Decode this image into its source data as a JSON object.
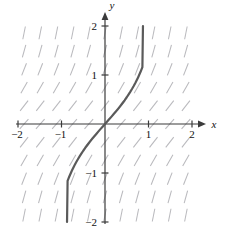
{
  "figure": {
    "title": "",
    "background": "#ffffff",
    "width": 229,
    "height": 231
  },
  "axes": {
    "x_label": "x",
    "y_label": "y",
    "x_ticks": [
      {
        "value": -2,
        "label": "−2"
      },
      {
        "value": -1,
        "label": "−1"
      },
      {
        "value": 1,
        "label": "1"
      },
      {
        "value": 2,
        "label": "2"
      }
    ],
    "y_ticks": [
      {
        "value": 2,
        "label": "2"
      },
      {
        "value": 1,
        "label": "1"
      },
      {
        "value": -1,
        "label": "−1"
      },
      {
        "value": -2,
        "label": "−2"
      }
    ],
    "axis_color": "#3b3b3b",
    "arrow_x": true,
    "arrow_y": true
  },
  "chart_data": {
    "type": "line",
    "title": "",
    "xlabel": "x",
    "ylabel": "y",
    "xlim": [
      -2,
      2
    ],
    "ylim": [
      -2,
      2
    ],
    "grid": false,
    "legend": null,
    "series": [
      {
        "name": "solution curve y = tan(x)",
        "color": "#5a5a5a",
        "linewidth": 2.2,
        "x": [
          -0.8726,
          -0.86,
          -0.84,
          -0.82,
          -0.8,
          -0.78,
          -0.76,
          -0.74,
          -0.72,
          -0.7,
          -0.66,
          -0.62,
          -0.58,
          -0.54,
          -0.5,
          -0.45,
          -0.4,
          -0.35,
          -0.3,
          -0.25,
          -0.2,
          -0.15,
          -0.1,
          -0.05,
          0.0,
          0.05,
          0.1,
          0.15,
          0.2,
          0.25,
          0.3,
          0.35,
          0.4,
          0.45,
          0.5,
          0.54,
          0.58,
          0.62,
          0.66,
          0.7,
          0.72,
          0.74,
          0.76,
          0.78,
          0.8,
          0.82,
          0.84,
          0.86,
          0.8726
        ],
        "y": [
          -2.0,
          -1.162,
          -1.116,
          -1.072,
          -1.03,
          -0.989,
          -0.95,
          -0.913,
          -0.877,
          -0.842,
          -0.776,
          -0.714,
          -0.656,
          -0.601,
          -0.546,
          -0.483,
          -0.423,
          -0.365,
          -0.309,
          -0.255,
          -0.203,
          -0.151,
          -0.1,
          -0.05,
          0.0,
          0.05,
          0.1,
          0.151,
          0.203,
          0.255,
          0.309,
          0.365,
          0.423,
          0.483,
          0.546,
          0.601,
          0.656,
          0.714,
          0.776,
          0.842,
          0.877,
          0.913,
          0.95,
          0.989,
          1.03,
          1.072,
          1.116,
          1.162,
          2.0
        ]
      }
    ],
    "slope_field": {
      "description": "direction field of dy/dx = 1 + y^2",
      "equation": "dy/dx = 1 + y^2",
      "color": "#b9b9bd",
      "dash_length": 13,
      "x_range": [
        -1.86,
        1.86
      ],
      "y_range": [
        -1.86,
        1.86
      ],
      "x_count": 11,
      "y_count": 11
    }
  }
}
